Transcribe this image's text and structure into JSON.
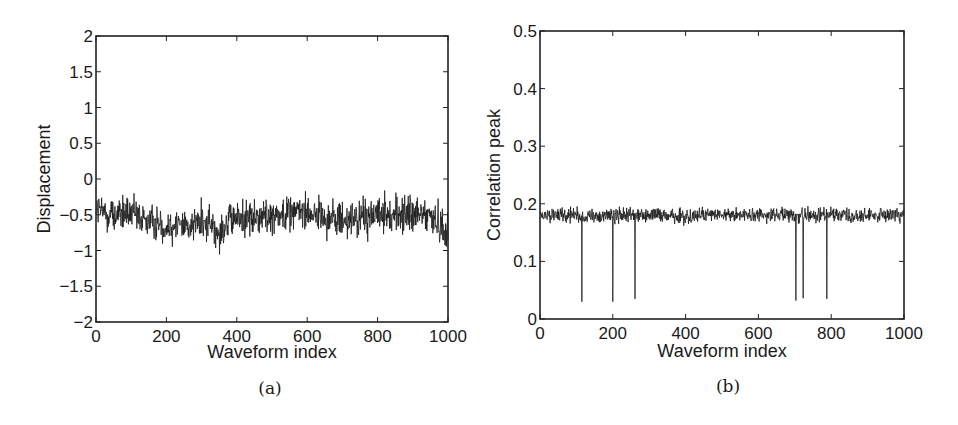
{
  "figure": {
    "panel_a_caption": "(a)",
    "panel_b_caption": "(b)"
  },
  "chart_data": [
    {
      "id": "a",
      "type": "line",
      "title": "",
      "caption": "(a)",
      "xlabel": "Waveform index",
      "ylabel": "Displacement",
      "xlim": [
        0,
        1000
      ],
      "ylim": [
        -2,
        2
      ],
      "xticks": [
        0,
        200,
        400,
        600,
        800,
        1000
      ],
      "yticks": [
        -2,
        -1.5,
        -1,
        -0.5,
        0,
        0.5,
        1,
        1.5,
        2
      ],
      "ytick_labels": [
        "−2",
        "−1.5",
        "−1",
        "−0.5",
        "0",
        "0.5",
        "1",
        "1.5",
        "2"
      ],
      "grid": false,
      "legend": null,
      "color": "#1a1a1a",
      "description": "Noisy displacement series of 1000 samples oscillating roughly between -1.2 and 0.2, centered near -0.55 with slow drift (dip around index 200-350, rise near 550-600).",
      "trend": {
        "x": [
          0,
          50,
          100,
          150,
          200,
          250,
          300,
          350,
          400,
          450,
          500,
          550,
          600,
          650,
          700,
          750,
          800,
          850,
          900,
          950,
          1000
        ],
        "mean": [
          -0.45,
          -0.5,
          -0.5,
          -0.6,
          -0.65,
          -0.65,
          -0.6,
          -0.7,
          -0.55,
          -0.55,
          -0.5,
          -0.45,
          -0.45,
          -0.55,
          -0.6,
          -0.55,
          -0.5,
          -0.5,
          -0.5,
          -0.5,
          -0.75
        ],
        "amplitude": 0.4
      },
      "range_observed": [
        -1.2,
        0.18
      ]
    },
    {
      "id": "b",
      "type": "line",
      "title": "",
      "caption": "(b)",
      "xlabel": "Waveform index",
      "ylabel": "Correlation peak",
      "xlim": [
        0,
        1000
      ],
      "ylim": [
        0,
        0.5
      ],
      "xticks": [
        0,
        200,
        400,
        600,
        800,
        1000
      ],
      "yticks": [
        0,
        0.1,
        0.2,
        0.3,
        0.4,
        0.5
      ],
      "ytick_labels": [
        "0",
        "0.1",
        "0.2",
        "0.3",
        "0.4",
        "0.5"
      ],
      "grid": false,
      "legend": null,
      "color": "#1a1a1a",
      "description": "Correlation peak series of 1000 samples fluctuating around 0.18 (range ~0.15-0.22) with six sharp dropouts to ~0.03.",
      "baseline_mean": 0.18,
      "baseline_range": [
        0.15,
        0.22
      ],
      "dropouts": [
        {
          "x": 115,
          "y": 0.03
        },
        {
          "x": 200,
          "y": 0.03
        },
        {
          "x": 261,
          "y": 0.035
        },
        {
          "x": 703,
          "y": 0.032
        },
        {
          "x": 723,
          "y": 0.036
        },
        {
          "x": 788,
          "y": 0.035
        }
      ]
    }
  ]
}
